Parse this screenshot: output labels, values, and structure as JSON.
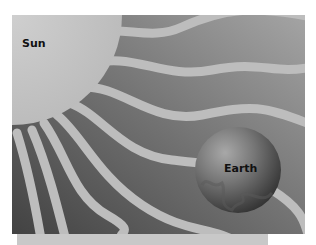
{
  "diagram": {
    "title": "",
    "labels": {
      "sun": "Sun",
      "earth": "Earth"
    },
    "elements": [
      {
        "name": "sun",
        "shape": "quarter-circle",
        "position": "top-left corner"
      },
      {
        "name": "rays",
        "shape": "wavy bands",
        "count": 8,
        "direction": "radiating from sun toward lower-right"
      },
      {
        "name": "earth",
        "shape": "sphere",
        "position": "lower-right"
      }
    ],
    "colors": {
      "background_dark": "#4a4a4a",
      "background_light": "#9a9a9a",
      "rays": "#bdbdbd",
      "sun": "#c4c4c4",
      "earth": "#6a6a6a",
      "bottom_strip": "#c8c8c8"
    }
  }
}
